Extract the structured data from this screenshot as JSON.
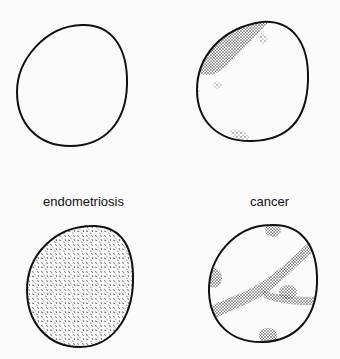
{
  "figure": {
    "title_clipped": "",
    "panels": [
      {
        "id": "normal",
        "label": "",
        "position": "top-left",
        "fill": "none"
      },
      {
        "id": "partial",
        "label": "",
        "position": "top-right",
        "fill": "stipple-regions"
      },
      {
        "id": "endometriosis",
        "label": "endometriosis",
        "position": "bottom-left",
        "fill": "dense-dash-stipple"
      },
      {
        "id": "cancer",
        "label": "cancer",
        "position": "bottom-right",
        "fill": "branching-stipple-bands"
      }
    ],
    "labels": {
      "endometriosis": "endometriosis",
      "cancer": "cancer"
    },
    "colors": {
      "background": "#fbfbfb",
      "outline": "#111111",
      "stipple": "#333333"
    }
  }
}
